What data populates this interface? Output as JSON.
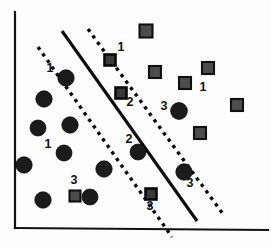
{
  "figure": {
    "title": "",
    "background_color": "#fdfdfd",
    "width": 271,
    "height": 247
  },
  "chart_data": {
    "type": "scatter",
    "title": "",
    "xlabel": "",
    "ylabel": "",
    "xlim": [
      0,
      271
    ],
    "ylim": [
      0,
      247
    ],
    "grid": false,
    "legend": null,
    "axes": {
      "y_axis": {
        "name": "y-axis",
        "x1": 15,
        "y1": 12,
        "x2": 15,
        "y2": 228,
        "color": "#111111"
      },
      "x_axis": {
        "name": "x-axis",
        "x1": 15,
        "y1": 228,
        "x2": 268,
        "y2": 230,
        "color": "#111111"
      }
    },
    "lines": [
      {
        "name": "decision-boundary",
        "style": "solid",
        "label": "hyperplane",
        "color": "#0d0d0d",
        "x1": 62,
        "y1": 31,
        "x2": 197,
        "y2": 221
      },
      {
        "name": "margin-left",
        "style": "dashed",
        "label": "margin",
        "color": "#0d0d0d",
        "x1": 38,
        "y1": 47,
        "x2": 172,
        "y2": 237
      },
      {
        "name": "margin-right",
        "style": "dashed",
        "label": "margin",
        "color": "#0d0d0d",
        "x1": 88,
        "y1": 29,
        "x2": 223,
        "y2": 214
      }
    ],
    "series": [
      {
        "name": "class-circle",
        "marker": "circle",
        "color": "#1b1b1b",
        "points": [
          {
            "x": 66,
            "y": 78,
            "r": 8.2,
            "label": "1",
            "label_pos": "left",
            "support_vector": true
          },
          {
            "x": 44,
            "y": 99,
            "r": 8.2,
            "label": "",
            "label_pos": "",
            "support_vector": false
          },
          {
            "x": 38,
            "y": 128,
            "r": 8.0,
            "label": "",
            "label_pos": "",
            "support_vector": false
          },
          {
            "x": 70,
            "y": 125,
            "r": 8.2,
            "label": "",
            "label_pos": "",
            "support_vector": false
          },
          {
            "x": 64,
            "y": 153,
            "r": 8.0,
            "label": "1",
            "label_pos": "left",
            "support_vector": false
          },
          {
            "x": 24,
            "y": 165,
            "r": 8.2,
            "label": "",
            "label_pos": "",
            "support_vector": false
          },
          {
            "x": 104,
            "y": 169,
            "r": 8.2,
            "label": "",
            "label_pos": "",
            "support_vector": false
          },
          {
            "x": 43,
            "y": 200,
            "r": 8.2,
            "label": "",
            "label_pos": "",
            "support_vector": false
          },
          {
            "x": 90,
            "y": 197,
            "r": 8.0,
            "label": "",
            "label_pos": "",
            "support_vector": false
          },
          {
            "x": 138,
            "y": 152,
            "r": 8.0,
            "label": "2",
            "label_pos": "upper-left",
            "support_vector": false
          },
          {
            "x": 179,
            "y": 111,
            "r": 8.4,
            "label": "3",
            "label_pos": "left",
            "support_vector": false
          },
          {
            "x": 184,
            "y": 172,
            "r": 8.2,
            "label": "3",
            "label_pos": "lower-right",
            "support_vector": false
          }
        ]
      },
      {
        "name": "class-square",
        "marker": "square",
        "color": "#4d4d4d",
        "points": [
          {
            "x": 110,
            "y": 60,
            "s": 11,
            "label": "1",
            "label_pos": "upper-right",
            "support_vector": true
          },
          {
            "x": 146,
            "y": 31,
            "s": 13,
            "label": "",
            "label_pos": "",
            "support_vector": false
          },
          {
            "x": 121,
            "y": 93,
            "s": 11,
            "label": "2",
            "label_pos": "lower-right",
            "support_vector": true
          },
          {
            "x": 155,
            "y": 72,
            "s": 12,
            "label": "",
            "label_pos": "",
            "support_vector": false
          },
          {
            "x": 185,
            "y": 83,
            "s": 12,
            "label": "",
            "label_pos": "",
            "support_vector": false
          },
          {
            "x": 208,
            "y": 68,
            "s": 12,
            "label": "1",
            "label_pos": "below",
            "support_vector": false
          },
          {
            "x": 237,
            "y": 105,
            "s": 12,
            "label": "",
            "label_pos": "",
            "support_vector": false
          },
          {
            "x": 200,
            "y": 133,
            "s": 12,
            "label": "",
            "label_pos": "",
            "support_vector": false
          },
          {
            "x": 151,
            "y": 194,
            "s": 11,
            "label": "3",
            "label_pos": "below",
            "support_vector": true
          },
          {
            "x": 75,
            "y": 196,
            "s": 11,
            "label": "3",
            "label_pos": "above",
            "support_vector": false
          }
        ]
      }
    ],
    "annotations": [
      {
        "text": "1",
        "x": 50,
        "y": 72,
        "name": "annotation-1-left-circle"
      },
      {
        "text": "1",
        "x": 48,
        "y": 148,
        "name": "annotation-1-left-lower"
      },
      {
        "text": "1",
        "x": 121,
        "y": 51,
        "name": "annotation-1-square-sv"
      },
      {
        "text": "1",
        "x": 203,
        "y": 91,
        "name": "annotation-1-right"
      },
      {
        "text": "2",
        "x": 130,
        "y": 106,
        "name": "annotation-2-square"
      },
      {
        "text": "2",
        "x": 129,
        "y": 143,
        "name": "annotation-2-circle"
      },
      {
        "text": "3",
        "x": 164,
        "y": 110,
        "name": "annotation-3-circle-upper"
      },
      {
        "text": "3",
        "x": 190,
        "y": 187,
        "name": "annotation-3-circle-lower"
      },
      {
        "text": "3",
        "x": 150,
        "y": 210,
        "name": "annotation-3-square-bottom"
      },
      {
        "text": "3",
        "x": 74,
        "y": 184,
        "name": "annotation-3-square-left"
      }
    ]
  }
}
